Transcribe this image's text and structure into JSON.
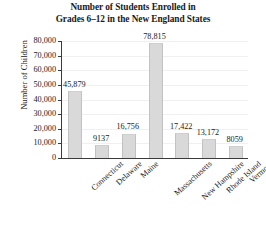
{
  "chart_data": {
    "type": "bar",
    "title": "Number of Students Enrolled in Grades 6–12 in the New England States",
    "title_lines": [
      "Number of Students Enrolled in",
      "Grades 6–12 in the New England States"
    ],
    "xlabel": "",
    "ylabel": "Number of Children",
    "categories": [
      "Connecticut",
      "Delaware",
      "Maine",
      "Massachusetts",
      "New Hampshire",
      "Rhode Island",
      "Vermont"
    ],
    "values": [
      45879,
      9137,
      16756,
      78815,
      17422,
      13172,
      8059
    ],
    "value_labels": [
      "45,879",
      "9137",
      "16,756",
      "78,815",
      "17,422",
      "13,172",
      "8059"
    ],
    "ylim": [
      0,
      80000
    ],
    "ytick_values": [
      0,
      10000,
      20000,
      30000,
      40000,
      50000,
      60000,
      70000,
      80000
    ],
    "ytick_labels": [
      "0",
      "10,000",
      "20,000",
      "30,000",
      "40,000",
      "50,000",
      "60,000",
      "70,000",
      "80,000"
    ],
    "grid": true,
    "legend": false,
    "bar_color": "#d9d9d9",
    "axis_color": "#3a3a3a",
    "text_color": "#1a1a1a"
  }
}
